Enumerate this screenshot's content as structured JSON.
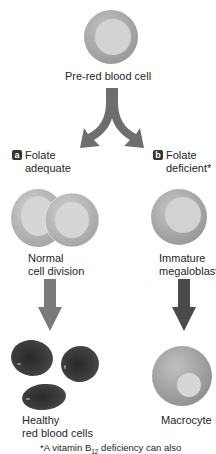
{
  "diagram": {
    "top": {
      "cell_label": "Pre-red blood cell"
    },
    "branches": [
      {
        "badge": "a",
        "condition_line1": "Folate",
        "condition_line2": "adequate",
        "middle_label_line1": "Normal",
        "middle_label_line2": "cell division",
        "result_label_line1": "Healthy",
        "result_label_line2": "red blood cells",
        "arrow_color": "#7a7a7a"
      },
      {
        "badge": "b",
        "condition_line1": "Folate",
        "condition_line2": "deficient*",
        "middle_label_line1": "Immature",
        "middle_label_line2": "megaloblast",
        "result_label_line1": "Macrocyte",
        "arrow_color": "#4a4a4a"
      }
    ],
    "footnote": {
      "prefix": "*A vitamin B",
      "subscript": "12",
      "suffix": " deficiency can also"
    },
    "colors": {
      "cell_outer": "#a9a9a9",
      "cell_inner": "#d4d4d4",
      "healthy_rbc": "#3a3a3a",
      "split_arrow": "#6e6e6e"
    }
  }
}
